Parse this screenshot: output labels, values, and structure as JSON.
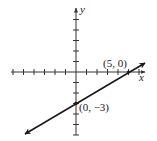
{
  "figure": {
    "type": "coordinate-plane-line-graph",
    "axes": {
      "x_label": "x",
      "y_label": "y",
      "x_ticks": [
        -6,
        -5,
        -4,
        -3,
        -2,
        -1,
        1,
        2,
        3,
        4,
        5,
        6
      ],
      "y_ticks": [
        5,
        4,
        3,
        2,
        1,
        -1,
        -2,
        -3,
        -4,
        -5,
        -6
      ],
      "grid": false
    },
    "line": {
      "description": "straight line with arrows at both ends",
      "points": [
        {
          "x": 5,
          "y": 0,
          "label": "(5, 0)"
        },
        {
          "x": 0,
          "y": -3,
          "label": "(0, −3)"
        }
      ]
    },
    "colors": {
      "ink": "#1a1a1a",
      "axis": "#333333",
      "background": "#ffffff"
    }
  }
}
